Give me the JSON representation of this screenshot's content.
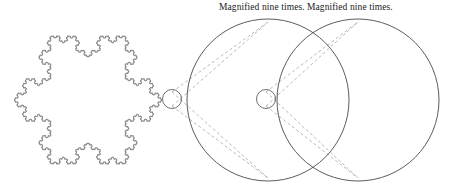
{
  "figure": {
    "background_color": "#ffffff",
    "stroke_color": "#4a4a4a",
    "dash_color": "#9a9a9a",
    "text_color": "#1a1a1a",
    "width": 451,
    "height": 189
  },
  "captions": {
    "left_label": "Magnified nine times.",
    "right_label": "Magnified nine times."
  },
  "shapes": {
    "snowflake": {
      "name": "koch-snowflake",
      "iterations": 5,
      "center_x": 88,
      "center_y": 100,
      "radius": 74
    },
    "detail_circle_1": {
      "name": "detail-circle-on-snowflake",
      "cx": 172,
      "cy": 99,
      "r": 9.5
    },
    "detail_circle_2": {
      "name": "detail-circle-on-middle-magnification",
      "cx": 266,
      "cy": 99,
      "r": 9.5
    },
    "magnifier_circle_1": {
      "name": "magnification-circle-middle",
      "cx": 268,
      "cy": 100,
      "r": 81
    },
    "magnifier_circle_2": {
      "name": "magnification-circle-right",
      "cx": 358,
      "cy": 100,
      "r": 81
    },
    "magnification_factor": "nine times"
  },
  "chart_data": {
    "type": "diagram",
    "annotations": [
      "Magnified nine times.",
      "Magnified nine times."
    ],
    "elements": [
      {
        "kind": "koch-snowflake",
        "iterations": 5,
        "cx": 88,
        "cy": 100,
        "r": 74
      },
      {
        "kind": "small-circle",
        "cx": 172,
        "cy": 99,
        "r": 9.5
      },
      {
        "kind": "large-circle",
        "cx": 268,
        "cy": 100,
        "r": 81
      },
      {
        "kind": "small-circle",
        "cx": 266,
        "cy": 99,
        "r": 9.5
      },
      {
        "kind": "large-circle",
        "cx": 358,
        "cy": 100,
        "r": 81
      }
    ],
    "magnification": 9
  }
}
